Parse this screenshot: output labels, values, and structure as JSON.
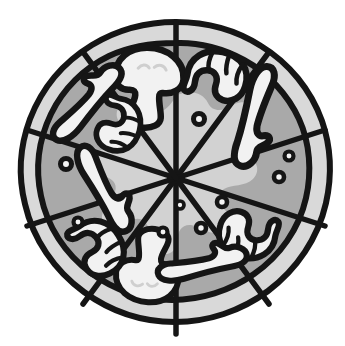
{
  "image": {
    "title": "Sliced pizza, top-down line illustration",
    "subject": "pizza",
    "style": "black-outline grayscale clip art",
    "background_color": "#ffffff",
    "width": 345,
    "height": 346
  },
  "colors": {
    "outline": "#151515",
    "crust": "#d9d9d9",
    "sauce": "#a9a9a9",
    "cheese": "#d2d2d2",
    "topping_fill": "#f2f2f2",
    "background": "#ffffff",
    "corner_mark": "#1a1a1a"
  },
  "pizza": {
    "center_x": 176,
    "center_y": 178,
    "outer_radius": 156,
    "crust_inner_radius": 135,
    "slice_count": 10,
    "slice_label": "pizza-slice",
    "regions": [
      {
        "name": "crust",
        "label": "Crust ring"
      },
      {
        "name": "sauce",
        "label": "Sauce and cheese base"
      },
      {
        "name": "cheese-blob",
        "label": "Melted cheese center"
      }
    ]
  },
  "toppings": {
    "mushrooms": [
      {
        "id": "mushroom-top",
        "cx": 149,
        "cy": 85,
        "rotation": 4,
        "scale": 1.0
      },
      {
        "id": "mushroom-bottom",
        "cx": 148,
        "cy": 268,
        "rotation": 186,
        "scale": 0.92
      }
    ],
    "pepperoni": [
      {
        "id": "pepperoni-top-right",
        "cx": 215,
        "cy": 79,
        "rotation": 12,
        "scale": 1.0
      },
      {
        "id": "pepperoni-upper-left",
        "cx": 116,
        "cy": 123,
        "rotation": 104,
        "scale": 0.88
      },
      {
        "id": "pepperoni-lower-left",
        "cx": 95,
        "cy": 248,
        "rotation": 58,
        "scale": 0.95
      },
      {
        "id": "pepperoni-lower-right",
        "cx": 249,
        "cy": 232,
        "rotation": 192,
        "scale": 0.95
      }
    ],
    "anchovies": [
      {
        "id": "anchovy-upper-left",
        "cx": 88,
        "cy": 105,
        "rotation": -28,
        "scale": 1.0
      },
      {
        "id": "anchovy-right",
        "cx": 253,
        "cy": 115,
        "rotation": 126,
        "scale": 1.08
      },
      {
        "id": "anchovy-left",
        "cx": 102,
        "cy": 189,
        "rotation": 82,
        "scale": 1.0
      },
      {
        "id": "anchovy-bottom-right",
        "cx": 202,
        "cy": 266,
        "rotation": 8,
        "scale": 0.95
      }
    ],
    "olives": [
      {
        "id": "olive-1",
        "cx": 199,
        "cy": 119,
        "r": 5.5
      },
      {
        "id": "olive-2",
        "cx": 289,
        "cy": 156,
        "r": 4.5
      },
      {
        "id": "olive-3",
        "cx": 279,
        "cy": 177,
        "r": 5.0
      },
      {
        "id": "olive-4",
        "cx": 222,
        "cy": 202,
        "r": 5.0
      },
      {
        "id": "olive-5",
        "cx": 201,
        "cy": 228,
        "r": 5.0
      },
      {
        "id": "olive-6",
        "cx": 180,
        "cy": 205,
        "r": 4.0
      },
      {
        "id": "olive-7",
        "cx": 163,
        "cy": 232,
        "r": 4.5
      },
      {
        "id": "olive-8",
        "cx": 66,
        "cy": 164,
        "r": 5.5
      },
      {
        "id": "olive-9",
        "cx": 78,
        "cy": 222,
        "r": 4.5
      }
    ]
  },
  "artifacts": {
    "corner_mark": {
      "visible": true,
      "x": 3,
      "y": 2,
      "width": 6,
      "height": 5
    }
  }
}
